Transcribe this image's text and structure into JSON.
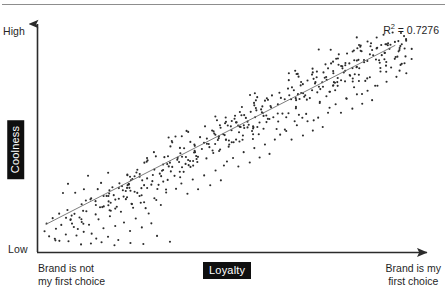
{
  "chart_data": {
    "type": "scatter",
    "title": "",
    "xlabel": "Loyalty",
    "ylabel": "Coolness",
    "x_axis": {
      "title": "Loyalty",
      "low_caption_line1": "Brand is not",
      "low_caption_line2": "my first choice",
      "high_caption_line1": "Brand is my",
      "high_caption_line2": "first choice",
      "range": [
        0,
        100
      ],
      "ticks": [],
      "grid": false
    },
    "y_axis": {
      "title": "Coolness",
      "low_label": "Low",
      "high_label": "High",
      "range": [
        0,
        100
      ],
      "ticks": [],
      "grid": false
    },
    "annotations": [
      {
        "name": "r-squared",
        "text": "R² = 0.7276",
        "symbol": "R",
        "superscript": "2",
        "equals": " = ",
        "value": "0.7276"
      }
    ],
    "trendline": {
      "type": "linear",
      "r_squared": 0.7276,
      "x_start": 1.5,
      "y_start": 10.5,
      "x_end": 93.5,
      "y_end": 90.5,
      "color": "#6e6e6e"
    },
    "marker": {
      "color": "#2b2b2b",
      "size_px": 1.6,
      "shape": "circle"
    },
    "n_points": 520,
    "points": [
      [
        1.2,
        7.5
      ],
      [
        2.4,
        5.2
      ],
      [
        3.9,
        4.1
      ],
      [
        5.1,
        3.2
      ],
      [
        4.2,
        8.6
      ],
      [
        6.8,
        6.0
      ],
      [
        7.5,
        3.0
      ],
      [
        8.9,
        9.4
      ],
      [
        9.6,
        5.6
      ],
      [
        10.8,
        1.6
      ],
      [
        11.5,
        7.2
      ],
      [
        12.9,
        10.4
      ],
      [
        13.6,
        6.4
      ],
      [
        14.8,
        4.2
      ],
      [
        15.4,
        12.8
      ],
      [
        16.7,
        8.8
      ],
      [
        17.9,
        5.0
      ],
      [
        18.4,
        14.2
      ],
      [
        19.8,
        9.8
      ],
      [
        20.6,
        3.6
      ],
      [
        21.3,
        16.2
      ],
      [
        22.1,
        11.4
      ],
      [
        23.7,
        7.6
      ],
      [
        24.5,
        18.0
      ],
      [
        25.2,
        13.2
      ],
      [
        26.8,
        9.2
      ],
      [
        27.4,
        20.4
      ],
      [
        28.6,
        15.4
      ],
      [
        29.3,
        11.0
      ],
      [
        30.1,
        22.2
      ],
      [
        21.8,
        25.8
      ],
      [
        23.4,
        28.4
      ],
      [
        25.6,
        24.6
      ],
      [
        26.9,
        30.2
      ],
      [
        28.2,
        26.8
      ],
      [
        29.7,
        32.6
      ],
      [
        31.2,
        28.2
      ],
      [
        32.4,
        34.8
      ],
      [
        33.6,
        30.4
      ],
      [
        34.8,
        36.2
      ],
      [
        18.6,
        20.2
      ],
      [
        19.4,
        23.6
      ],
      [
        20.2,
        18.4
      ],
      [
        22.6,
        21.8
      ],
      [
        24.2,
        19.6
      ],
      [
        26.2,
        23.2
      ],
      [
        27.8,
        17.8
      ],
      [
        30.6,
        21.4
      ],
      [
        31.8,
        19.2
      ],
      [
        33.2,
        24.8
      ],
      [
        35.4,
        32.2
      ],
      [
        36.6,
        38.4
      ],
      [
        37.8,
        34.0
      ],
      [
        38.4,
        40.6
      ],
      [
        39.6,
        36.2
      ],
      [
        40.8,
        42.8
      ],
      [
        41.4,
        38.4
      ],
      [
        42.6,
        44.2
      ],
      [
        43.8,
        40.0
      ],
      [
        44.4,
        46.4
      ],
      [
        35.8,
        26.4
      ],
      [
        37.2,
        28.8
      ],
      [
        38.8,
        24.2
      ],
      [
        40.2,
        30.6
      ],
      [
        41.6,
        26.2
      ],
      [
        43.2,
        32.4
      ],
      [
        44.8,
        28.0
      ],
      [
        46.2,
        34.6
      ],
      [
        47.6,
        30.2
      ],
      [
        48.4,
        36.8
      ],
      [
        45.6,
        42.4
      ],
      [
        46.8,
        48.2
      ],
      [
        47.4,
        44.0
      ],
      [
        48.6,
        50.4
      ],
      [
        49.8,
        46.2
      ],
      [
        50.4,
        52.6
      ],
      [
        51.6,
        48.4
      ],
      [
        52.8,
        54.0
      ],
      [
        53.4,
        50.2
      ],
      [
        54.6,
        56.4
      ],
      [
        49.2,
        38.6
      ],
      [
        50.8,
        40.2
      ],
      [
        52.2,
        36.4
      ],
      [
        53.6,
        42.8
      ],
      [
        55.2,
        38.2
      ],
      [
        56.4,
        44.6
      ],
      [
        57.8,
        40.4
      ],
      [
        59.2,
        46.2
      ],
      [
        60.4,
        42.0
      ],
      [
        61.8,
        48.4
      ],
      [
        55.8,
        52.2
      ],
      [
        56.6,
        58.4
      ],
      [
        57.2,
        54.0
      ],
      [
        58.4,
        60.6
      ],
      [
        59.6,
        56.2
      ],
      [
        60.8,
        62.8
      ],
      [
        61.4,
        58.4
      ],
      [
        62.6,
        64.2
      ],
      [
        63.8,
        60.0
      ],
      [
        64.4,
        66.4
      ],
      [
        63.2,
        50.6
      ],
      [
        64.8,
        52.2
      ],
      [
        66.2,
        48.4
      ],
      [
        67.6,
        54.8
      ],
      [
        69.2,
        50.2
      ],
      [
        70.4,
        56.6
      ],
      [
        71.8,
        52.4
      ],
      [
        73.2,
        58.2
      ],
      [
        74.4,
        54.0
      ],
      [
        75.8,
        60.4
      ],
      [
        65.6,
        68.2
      ],
      [
        66.8,
        70.4
      ],
      [
        67.4,
        66.0
      ],
      [
        68.6,
        72.6
      ],
      [
        69.8,
        68.2
      ],
      [
        70.4,
        74.8
      ],
      [
        71.6,
        70.4
      ],
      [
        72.8,
        76.2
      ],
      [
        73.4,
        72.0
      ],
      [
        74.6,
        78.4
      ],
      [
        76.2,
        62.6
      ],
      [
        77.8,
        64.2
      ],
      [
        79.2,
        60.4
      ],
      [
        80.6,
        66.8
      ],
      [
        82.2,
        62.2
      ],
      [
        83.4,
        68.6
      ],
      [
        84.8,
        64.4
      ],
      [
        86.2,
        70.2
      ],
      [
        87.4,
        66.0
      ],
      [
        88.8,
        72.4
      ],
      [
        75.8,
        80.2
      ],
      [
        76.6,
        82.4
      ],
      [
        77.2,
        78.0
      ],
      [
        78.4,
        84.6
      ],
      [
        79.6,
        80.2
      ],
      [
        80.8,
        86.8
      ],
      [
        81.4,
        82.4
      ],
      [
        82.6,
        88.2
      ],
      [
        83.8,
        84.0
      ],
      [
        84.4,
        90.4
      ],
      [
        85.6,
        74.6
      ],
      [
        86.8,
        76.2
      ],
      [
        88.2,
        72.4
      ],
      [
        89.6,
        78.8
      ],
      [
        91.2,
        74.2
      ],
      [
        92.4,
        80.6
      ],
      [
        93.8,
        76.4
      ],
      [
        95.2,
        82.2
      ],
      [
        96.4,
        78.0
      ],
      [
        97.8,
        84.4
      ],
      [
        86.2,
        92.2
      ],
      [
        87.4,
        88.4
      ],
      [
        88.6,
        94.0
      ],
      [
        89.8,
        90.6
      ],
      [
        90.4,
        95.2
      ],
      [
        91.6,
        91.4
      ],
      [
        92.8,
        96.2
      ],
      [
        93.4,
        92.0
      ],
      [
        94.6,
        88.4
      ],
      [
        95.8,
        94.6
      ],
      [
        13.4,
        2.0
      ],
      [
        16.2,
        2.6
      ],
      [
        19.6,
        1.2
      ],
      [
        23.8,
        2.2
      ],
      [
        27.2,
        1.8
      ],
      [
        30.8,
        5.4
      ],
      [
        34.2,
        2.8
      ],
      [
        12.2,
        16.4
      ],
      [
        15.8,
        18.2
      ],
      [
        10.4,
        13.6
      ]
    ],
    "scatter_seed": 20240717
  },
  "figure": {
    "background": "#ffffff",
    "top_rule_color": "#8d8d8d",
    "axis_color": "#2b2b2b",
    "badge_background": "#0f0f0f",
    "badge_text_color": "#ffffff",
    "text_color": "#1f1f1f"
  },
  "labels": {
    "y_high": "High",
    "y_low": "Low",
    "y_title": "Coolness",
    "x_title": "Loyalty",
    "x_left_line1": "Brand is not",
    "x_left_line2": "my first choice",
    "x_right_line1": "Brand is my",
    "x_right_line2": "first choice",
    "r2_prefix": "R",
    "r2_sup": "2",
    "r2_suffix": " = 0.7276"
  }
}
